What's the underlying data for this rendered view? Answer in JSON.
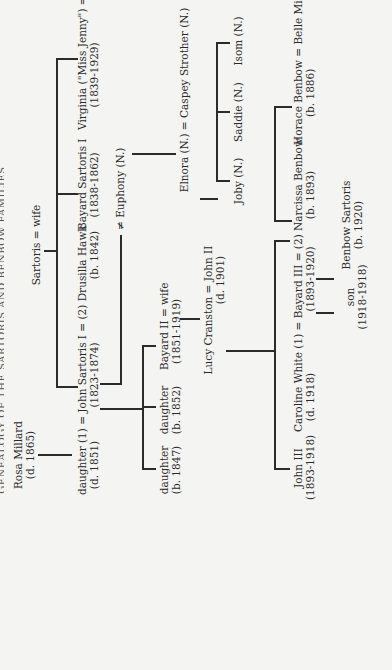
{
  "title": "GENEALOGY OF THE SARTORIS AND BENBOW FAMILIES",
  "root": {
    "label": "Sartoris = wife"
  },
  "people": {
    "rosa_millard": {
      "name": "Rosa Millard",
      "dates": "(d. 1865)"
    },
    "daughter_1851": {
      "name": "daughter (1) = John Sartoris I = (2) Drusilla Hawk",
      "dates_left": "(d. 1851)",
      "dates_mid": "(1823-1874)",
      "dates_right": "(b. 1842)"
    },
    "bayard_sartoris_i": {
      "name": "Bayard Sartoris I",
      "dates": "(1838-1862)"
    },
    "virginia": {
      "name": "Virginia (\"Miss Jenny\") = DuPre",
      "dates": "(1839-1929)"
    },
    "euphony": {
      "name": "≠ Euphony (N.)"
    },
    "elnora": {
      "name": "Elnora (N.) = Caspey Strother (N.)"
    },
    "joby": {
      "name": "Joby (N.)"
    },
    "saddie": {
      "name": "Saddie (N.)"
    },
    "isom": {
      "name": "Isom (N.)"
    },
    "daughter_1847": {
      "name": "daughter",
      "dates": "(b. 1847)"
    },
    "daughter_1852": {
      "name": "daughter",
      "dates": "(b. 1852)"
    },
    "bayard_ii": {
      "name": "Bayard II = wife",
      "dates": "(1851-1919)"
    },
    "lucy_john_ii": {
      "name": "Lucy Cranston = John II",
      "dates": "(d. 1901)"
    },
    "john_iii": {
      "name": "John III",
      "dates": "(1893-1918)"
    },
    "caroline_bayard_iii": {
      "name": "Caroline White (1) = Bayard III = (2) Narcissa Benbow",
      "dates_left": "(d. 1918)",
      "dates_mid": "(1893-1920)",
      "dates_right": "(b. 1893)"
    },
    "son": {
      "name": "son",
      "dates": "(1918-1918)"
    },
    "benbow_sartoris": {
      "name": "Benbow Sartoris",
      "dates": "(b. 1920)"
    },
    "horace_benbow": {
      "name": "Horace Benbow = Belle Mitchell",
      "dates": "(b. 1886)"
    }
  }
}
